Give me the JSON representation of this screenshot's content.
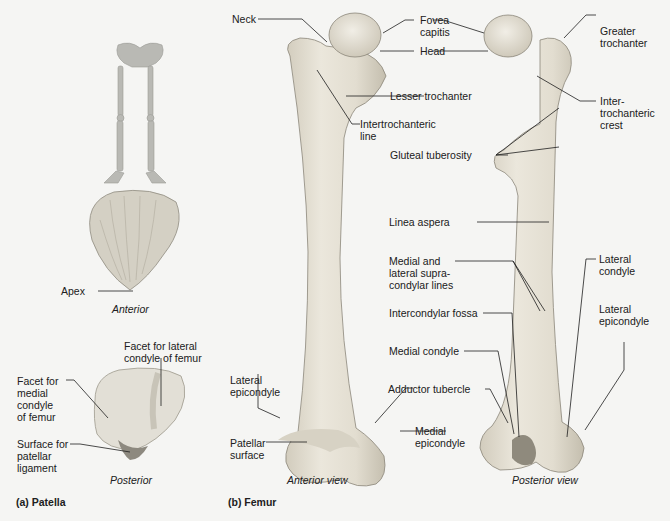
{
  "figure": {
    "panels": [
      {
        "id": "a",
        "title": "(a) Patella"
      },
      {
        "id": "b",
        "title": "(b) Femur"
      }
    ],
    "patella": {
      "views": {
        "anterior": "Anterior",
        "posterior": "Posterior"
      },
      "labels": {
        "apex": "Apex",
        "facet_lateral": "Facet for lateral\ncondyle of femur",
        "facet_medial": "Facet for\nmedial\ncondyle\nof femur",
        "surface_ligament": "Surface for\npatellar\nligament"
      }
    },
    "femur": {
      "views": {
        "anterior": "Anterior view",
        "posterior": "Posterior view"
      },
      "labels": {
        "neck": "Neck",
        "fovea_capitis": "Fovea\ncapitis",
        "head": "Head",
        "greater_trochanter": "Greater\ntrochanter",
        "lesser_trochanter": "Lesser trochanter",
        "intertrochanteric_line": "Intertrochanteric\nline",
        "intertrochanteric_crest": "Inter-\ntrochanteric\ncrest",
        "gluteal_tuberosity": "Gluteal tuberosity",
        "linea_aspera": "Linea aspera",
        "supracondylar_lines": "Medial and\nlateral supra-\ncondylar lines",
        "lateral_condyle": "Lateral\ncondyle",
        "lateral_epicondyle_post": "Lateral\nepicondyle",
        "intercondylar_fossa": "Intercondylar fossa",
        "medial_condyle": "Medial condyle",
        "adductor_tubercle": "Adductor tubercle",
        "medial_epicondyle": "Medial\nepicondyle",
        "lateral_epicondyle_ant": "Lateral\nepicondyle",
        "patellar_surface": "Patellar\nsurface"
      }
    },
    "colors": {
      "background": "#f5f5f3",
      "bone": "#e2ddd0",
      "bone_shadow": "#c9c3b3",
      "leader": "#1e1e1e"
    }
  }
}
